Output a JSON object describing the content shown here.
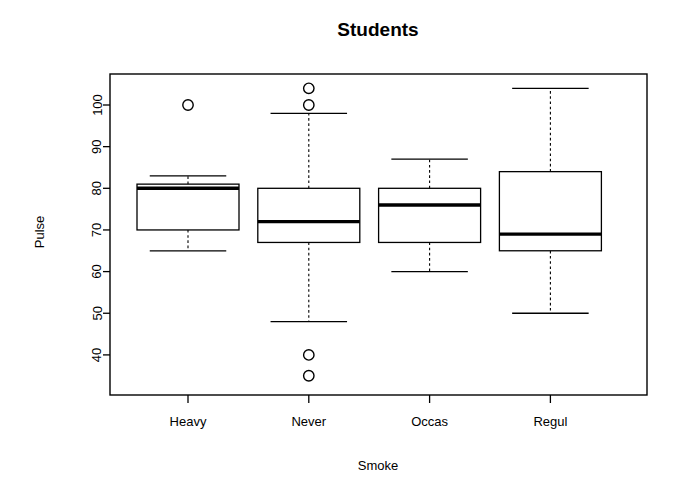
{
  "chart_data": {
    "type": "box",
    "title": "Students",
    "xlabel": "Smoke",
    "ylabel": "Pulse",
    "categories": [
      "Heavy",
      "Never",
      "Occas",
      "Regul"
    ],
    "ylim": [
      33,
      106
    ],
    "yticks": [
      40,
      50,
      60,
      70,
      80,
      90,
      100
    ],
    "ytick_labels": [
      "40",
      "50",
      "60",
      "70",
      "80",
      "90",
      "100"
    ],
    "grid": false,
    "legend": "none",
    "boxes": [
      {
        "category": "Heavy",
        "whisker_low": 65,
        "q1": 70,
        "median": 80,
        "q3": 81,
        "whisker_high": 83,
        "outliers": [
          100
        ]
      },
      {
        "category": "Never",
        "whisker_low": 48,
        "q1": 67,
        "median": 72,
        "q3": 80,
        "whisker_high": 98,
        "outliers": [
          104,
          100,
          40,
          35
        ]
      },
      {
        "category": "Occas",
        "whisker_low": 60,
        "q1": 67,
        "median": 76,
        "q3": 80,
        "whisker_high": 87,
        "outliers": []
      },
      {
        "category": "Regul",
        "whisker_low": 50,
        "q1": 65,
        "median": 69,
        "q3": 84,
        "whisker_high": 104,
        "outliers": []
      }
    ],
    "colors": {
      "background": "#ffffff",
      "line": "#000000",
      "box_fill": "#ffffff"
    }
  }
}
